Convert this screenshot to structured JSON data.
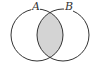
{
  "diagram": {
    "type": "venn",
    "sets": [
      {
        "label": "A",
        "cx": 37,
        "cy": 35,
        "r": 26
      },
      {
        "label": "B",
        "cx": 63,
        "cy": 35,
        "r": 26
      }
    ],
    "shaded_region": "A ∩ B",
    "colors": {
      "stroke": "#333333",
      "shade": "#d4d4d4",
      "background": "#ffffff"
    }
  }
}
